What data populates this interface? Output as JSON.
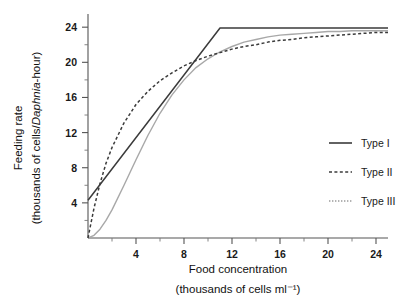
{
  "chart_data": {
    "type": "line",
    "title": "",
    "xlabel": "Food concentration",
    "xlabel_sub": "(thousands of cells ml⁻¹)",
    "ylabel": "Feeding rate",
    "ylabel_sub_pre": "(thousands of cells/",
    "ylabel_sub_italic": "Daphnia",
    "ylabel_sub_post": "-hour)",
    "xlim": [
      0,
      25
    ],
    "ylim": [
      0,
      25.5
    ],
    "xticks": [
      4,
      8,
      12,
      16,
      20,
      24
    ],
    "yticks": [
      4,
      8,
      12,
      16,
      20,
      24
    ],
    "x_minor_step": 2,
    "y_minor_step": 2,
    "grid": false,
    "legend_position": "right",
    "series": [
      {
        "name": "Type I",
        "style": "solid",
        "color": "#3b3b3b",
        "description": "Linear rise from intercept then abrupt plateau",
        "x": [
          0,
          11,
          25
        ],
        "y": [
          4.3,
          23.9,
          23.9
        ]
      },
      {
        "name": "Type II",
        "style": "dashed",
        "color": "#3b3b3b",
        "description": "Hyperbolic saturating (Holling type II)",
        "x": [
          0,
          0.5,
          1,
          1.5,
          2,
          3,
          4,
          5,
          6,
          7,
          8,
          9,
          10,
          11,
          12,
          13,
          14,
          15,
          16,
          17,
          18,
          19,
          20,
          21,
          22,
          23,
          24,
          25
        ],
        "y": [
          0.0,
          3.4,
          6.2,
          8.5,
          10.3,
          13.1,
          15.2,
          16.7,
          17.9,
          18.8,
          19.6,
          20.2,
          20.7,
          21.1,
          21.5,
          21.8,
          22.0,
          22.3,
          22.5,
          22.6,
          22.8,
          22.9,
          23.0,
          23.1,
          23.2,
          23.3,
          23.4,
          23.4
        ]
      },
      {
        "name": "Type III",
        "style": "dotted",
        "color": "#a8a8a8",
        "description": "Sigmoid (Holling type III)",
        "x": [
          0,
          0.5,
          1,
          1.5,
          2,
          3,
          4,
          5,
          6,
          7,
          8,
          9,
          10,
          11,
          12,
          13,
          14,
          15,
          16,
          17,
          18,
          19,
          20,
          21,
          22,
          23,
          24,
          25
        ],
        "y": [
          0.0,
          0.3,
          1.0,
          2.0,
          3.2,
          6.0,
          8.9,
          11.7,
          14.2,
          16.3,
          18.0,
          19.4,
          20.4,
          21.2,
          21.8,
          22.3,
          22.6,
          22.9,
          23.1,
          23.2,
          23.3,
          23.4,
          23.5,
          23.5,
          23.6,
          23.6,
          23.6,
          23.6
        ]
      }
    ]
  },
  "legend": {
    "items": [
      {
        "label": "Type I"
      },
      {
        "label": "Type II"
      },
      {
        "label": "Type III"
      }
    ]
  },
  "axes": {
    "x_tick_labels": [
      "4",
      "8",
      "12",
      "16",
      "20",
      "24"
    ],
    "y_tick_labels": [
      "4",
      "8",
      "12",
      "16",
      "20",
      "24"
    ]
  },
  "colors": {
    "background": "#ffffff",
    "axis": "#555555",
    "type1": "#3b3b3b",
    "type2": "#3b3b3b",
    "type3": "#a8a8a8",
    "text": "#111111"
  }
}
